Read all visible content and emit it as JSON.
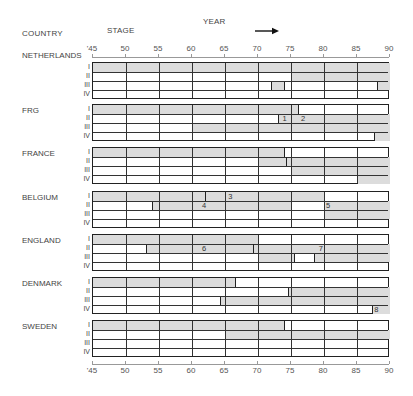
{
  "header": {
    "country_label": "COUNTRY",
    "stage_label": "STAGE",
    "year_label": "YEAR"
  },
  "chart_data": {
    "type": "gantt",
    "title": "",
    "xlabel": "YEAR",
    "ylabel": "COUNTRY / STAGE",
    "xlim": [
      1945,
      1990
    ],
    "x_ticks": [
      "'45",
      "50",
      "55",
      "60",
      "65",
      "70",
      "75",
      "80",
      "85",
      "90"
    ],
    "stages": [
      "I",
      "II",
      "III",
      "IV"
    ],
    "countries": [
      {
        "name": "NETHERLANDS",
        "stages": {
          "I": [
            [
              45,
              90
            ]
          ],
          "II": [
            [
              75,
              90
            ]
          ],
          "III": [
            [
              72,
              74
            ],
            [
              88,
              90
            ]
          ],
          "IV": []
        },
        "markers": [],
        "annotations": []
      },
      {
        "name": "FRG",
        "stages": {
          "I": [
            [
              45,
              76
            ]
          ],
          "II": [
            [
              73,
              90
            ]
          ],
          "III": [
            [
              60,
              90
            ]
          ],
          "IV": [
            [
              87.5,
              90
            ]
          ]
        },
        "markers": [],
        "annotations": [
          {
            "stage": "II",
            "year": 73.7,
            "label": "1"
          },
          {
            "stage": "II",
            "year": 76.5,
            "label": "2"
          }
        ]
      },
      {
        "name": "FRANCE",
        "stages": {
          "I": [
            [
              45,
              74
            ]
          ],
          "II": [
            [
              70,
              90
            ]
          ],
          "III": [
            [
              75,
              90
            ]
          ],
          "IV": [
            [
              85,
              90
            ]
          ]
        },
        "markers": [
          {
            "stage": "II",
            "year": 74.2
          }
        ],
        "annotations": []
      },
      {
        "name": "BELGIUM",
        "stages": {
          "I": [
            [
              45,
              80
            ]
          ],
          "II": [
            [
              54,
              75
            ],
            [
              80,
              90
            ]
          ],
          "III": [
            [
              80,
              90
            ]
          ],
          "IV": []
        },
        "markers": [
          {
            "stage": "I",
            "year": 62
          }
        ],
        "annotations": [
          {
            "stage": "I",
            "year": 65.5,
            "label": "3"
          },
          {
            "stage": "II",
            "year": 61.5,
            "label": "4"
          },
          {
            "stage": "II",
            "year": 80.3,
            "label": "5"
          }
        ]
      },
      {
        "name": "ENGLAND",
        "stages": {
          "I": [
            [
              45,
              70
            ]
          ],
          "II": [
            [
              53,
              90
            ]
          ],
          "III": [
            [
              70,
              75.5
            ],
            [
              78.5,
              90
            ]
          ],
          "IV": []
        },
        "markers": [
          {
            "stage": "II",
            "year": 69.2
          }
        ],
        "annotations": [
          {
            "stage": "II",
            "year": 61.5,
            "label": "6"
          },
          {
            "stage": "II",
            "year": 79.2,
            "label": "7"
          }
        ]
      },
      {
        "name": "DENMARK",
        "stages": {
          "I": [
            [
              45,
              66.5
            ]
          ],
          "II": [
            [
              74.5,
              90
            ]
          ],
          "III": [
            [
              64.3,
              90
            ]
          ],
          "IV": [
            [
              87.3,
              90
            ]
          ]
        },
        "markers": [],
        "annotations": [
          {
            "stage": "IV",
            "year": 87.6,
            "label": "8"
          }
        ]
      },
      {
        "name": "SWEDEN",
        "stages": {
          "I": [
            [
              45,
              74
            ]
          ],
          "II": [
            [
              65,
              90
            ]
          ],
          "III": [],
          "IV": []
        },
        "markers": [],
        "annotations": []
      }
    ],
    "grid": true,
    "shading_color": "#dcdcdc",
    "legend": null
  }
}
